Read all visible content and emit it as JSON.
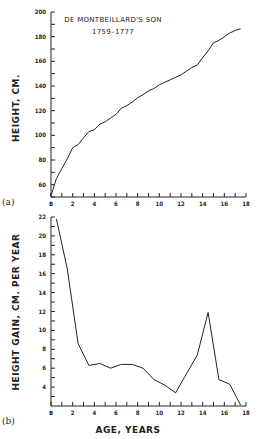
{
  "chart_data": [
    {
      "type": "line",
      "panel_label": "(a)",
      "title": "DE MONTBEILLARD'S SON",
      "subtitle": "1759–1777",
      "xlabel": "",
      "ylabel": "HEIGHT, CM.",
      "xlim": [
        0,
        18
      ],
      "ylim": [
        50,
        200
      ],
      "x_ticks": [
        0,
        2,
        4,
        6,
        8,
        10,
        12,
        14,
        16,
        18
      ],
      "x_tick_labels": [
        "B",
        "2",
        "4",
        "6",
        "8",
        "10",
        "12",
        "14",
        "16",
        "18"
      ],
      "y_ticks": [
        60,
        80,
        100,
        120,
        140,
        160,
        180,
        200
      ],
      "y_tick_labels": [
        "60",
        "80",
        "100",
        "120",
        "140",
        "160",
        "180",
        "200"
      ],
      "grid": false,
      "x": [
        0,
        0.5,
        1,
        1.5,
        2,
        2.5,
        3,
        3.5,
        4,
        4.5,
        5,
        5.5,
        6,
        6.5,
        7,
        7.5,
        8,
        8.5,
        9,
        9.5,
        10,
        10.5,
        11,
        11.5,
        12,
        12.5,
        13,
        13.5,
        14,
        14.5,
        15,
        15.5,
        16,
        16.5,
        17,
        17.5
      ],
      "values": [
        51,
        65,
        73,
        81,
        90,
        92.5,
        98,
        103,
        104.5,
        109,
        111,
        114,
        117,
        122,
        124,
        127,
        130.5,
        133,
        136,
        138,
        141,
        143,
        145,
        147,
        149,
        152,
        155,
        157,
        163,
        168.5,
        175,
        177,
        180,
        183,
        185,
        186.5
      ]
    },
    {
      "type": "line",
      "panel_label": "(b)",
      "title": "",
      "xlabel": "AGE, YEARS",
      "ylabel": "HEIGHT GAIN, CM. PER YEAR",
      "xlim": [
        0,
        18
      ],
      "ylim": [
        2,
        22
      ],
      "x_ticks": [
        0,
        2,
        4,
        6,
        8,
        10,
        12,
        14,
        16,
        18
      ],
      "x_tick_labels": [
        "B",
        "2",
        "4",
        "6",
        "8",
        "10",
        "12",
        "14",
        "16",
        "18"
      ],
      "y_ticks": [
        4,
        6,
        8,
        10,
        12,
        14,
        16,
        18,
        20,
        22
      ],
      "y_tick_labels": [
        "4",
        "6",
        "8",
        "10",
        "12",
        "14",
        "16",
        "18",
        "20",
        "22"
      ],
      "grid": false,
      "x": [
        0.5,
        1.5,
        2.5,
        3.5,
        4.5,
        5.5,
        6.5,
        7.5,
        8.5,
        9.5,
        10.5,
        11.5,
        12.5,
        13.5,
        14.5,
        15.5,
        16.5,
        17.5
      ],
      "values": [
        21.8,
        16.5,
        8.6,
        6.3,
        6.5,
        6.0,
        6.4,
        6.4,
        6.0,
        4.8,
        4.2,
        3.4,
        5.4,
        7.4,
        11.9,
        4.8,
        4.3,
        2.1
      ]
    }
  ],
  "panels": [
    {
      "label": "(a)",
      "title": "DE MONTBEILLARD'S SON",
      "subtitle": "1759–1777",
      "ylabel": "HEIGHT, CM.",
      "xlabel": ""
    },
    {
      "label": "(b)",
      "title": "",
      "subtitle": "",
      "ylabel": "HEIGHT GAIN, CM. PER YEAR",
      "xlabel": "AGE, YEARS"
    }
  ],
  "colors": {
    "line": "#222222",
    "background": "#ffffff"
  }
}
